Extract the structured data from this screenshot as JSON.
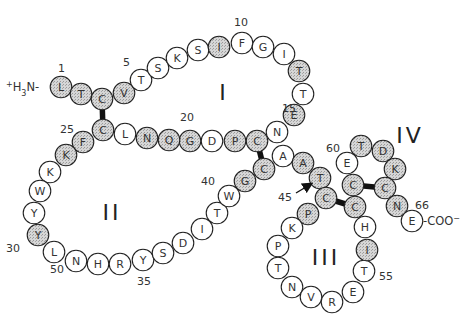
{
  "diagram": {
    "title": "",
    "n_terminus": "+H3N-",
    "c_terminus": "-COO−",
    "loops": [
      {
        "label": "I",
        "x": 224,
        "y": 100
      },
      {
        "label": "II",
        "x": 112,
        "y": 220
      },
      {
        "label": "III",
        "x": 326,
        "y": 265
      },
      {
        "label": "IV",
        "x": 410,
        "y": 143
      }
    ],
    "position_labels": [
      {
        "text": "1",
        "x": 58,
        "y": 72
      },
      {
        "text": "5",
        "x": 123,
        "y": 66
      },
      {
        "text": "10",
        "x": 234,
        "y": 26
      },
      {
        "text": "15",
        "x": 282,
        "y": 112
      },
      {
        "text": "20",
        "x": 180,
        "y": 121
      },
      {
        "text": "25",
        "x": 60,
        "y": 133
      },
      {
        "text": "30",
        "x": 6,
        "y": 252
      },
      {
        "text": "35",
        "x": 137,
        "y": 285
      },
      {
        "text": "40",
        "x": 201,
        "y": 185
      },
      {
        "text": "45",
        "x": 278,
        "y": 201
      },
      {
        "text": "50",
        "x": 50,
        "y": 273
      },
      {
        "text": "55",
        "x": 379,
        "y": 280
      },
      {
        "text": "60",
        "x": 326,
        "y": 152
      },
      {
        "text": "66",
        "x": 415,
        "y": 209
      }
    ],
    "colors": {
      "shaded": "#c8c8c8",
      "unshaded": "#ffffff",
      "stroke": "#222222",
      "bond": "#111111"
    },
    "residues": [
      {
        "n": 1,
        "aa": "L",
        "x": 61,
        "y": 87,
        "shaded": true
      },
      {
        "n": 2,
        "aa": "T",
        "x": 81,
        "y": 94,
        "shaded": true
      },
      {
        "n": 3,
        "aa": "C",
        "x": 102,
        "y": 99,
        "shaded": true
      },
      {
        "n": 4,
        "aa": "V",
        "x": 124,
        "y": 93,
        "shaded": true
      },
      {
        "n": 5,
        "aa": "T",
        "x": 141,
        "y": 80,
        "shaded": false
      },
      {
        "n": 6,
        "aa": "S",
        "x": 158,
        "y": 68,
        "shaded": false
      },
      {
        "n": 7,
        "aa": "K",
        "x": 177,
        "y": 58,
        "shaded": false
      },
      {
        "n": 8,
        "aa": "S",
        "x": 198,
        "y": 50,
        "shaded": false
      },
      {
        "n": 9,
        "aa": "I",
        "x": 219,
        "y": 47,
        "shaded": true
      },
      {
        "n": 10,
        "aa": "F",
        "x": 242,
        "y": 43,
        "shaded": false
      },
      {
        "n": 11,
        "aa": "G",
        "x": 263,
        "y": 47,
        "shaded": false
      },
      {
        "n": 12,
        "aa": "I",
        "x": 284,
        "y": 54,
        "shaded": false
      },
      {
        "n": 13,
        "aa": "T",
        "x": 299,
        "y": 71,
        "shaded": true
      },
      {
        "n": 14,
        "aa": "T",
        "x": 303,
        "y": 94,
        "shaded": false
      },
      {
        "n": 15,
        "aa": "E",
        "x": 294,
        "y": 115,
        "shaded": true
      },
      {
        "n": 16,
        "aa": "N",
        "x": 277,
        "y": 132,
        "shaded": false
      },
      {
        "n": 17,
        "aa": "C",
        "x": 257,
        "y": 141,
        "shaded": true
      },
      {
        "n": 18,
        "aa": "P",
        "x": 235,
        "y": 141,
        "shaded": true
      },
      {
        "n": 19,
        "aa": "D",
        "x": 212,
        "y": 141,
        "shaded": false
      },
      {
        "n": 20,
        "aa": "G",
        "x": 190,
        "y": 141,
        "shaded": true
      },
      {
        "n": 21,
        "aa": "Q",
        "x": 169,
        "y": 140,
        "shaded": true
      },
      {
        "n": 22,
        "aa": "N",
        "x": 147,
        "y": 138,
        "shaded": true
      },
      {
        "n": 23,
        "aa": "L",
        "x": 125,
        "y": 134,
        "shaded": false
      },
      {
        "n": 24,
        "aa": "C",
        "x": 103,
        "y": 130,
        "shaded": true
      },
      {
        "n": 25,
        "aa": "F",
        "x": 83,
        "y": 142,
        "shaded": true
      },
      {
        "n": 26,
        "aa": "K",
        "x": 66,
        "y": 155,
        "shaded": true
      },
      {
        "n": 27,
        "aa": "K",
        "x": 50,
        "y": 172,
        "shaded": false
      },
      {
        "n": 28,
        "aa": "W",
        "x": 40,
        "y": 191,
        "shaded": false
      },
      {
        "n": 29,
        "aa": "Y",
        "x": 34,
        "y": 213,
        "shaded": false
      },
      {
        "n": 30,
        "aa": "Y",
        "x": 38,
        "y": 235,
        "shaded": true
      },
      {
        "n": 31,
        "aa": "L",
        "x": 54,
        "y": 252,
        "shaded": false
      },
      {
        "n": 32,
        "aa": "N",
        "x": 76,
        "y": 261,
        "shaded": false
      },
      {
        "n": 33,
        "aa": "H",
        "x": 98,
        "y": 264,
        "shaded": false
      },
      {
        "n": 34,
        "aa": "R",
        "x": 120,
        "y": 264,
        "shaded": false
      },
      {
        "n": 35,
        "aa": "Y",
        "x": 143,
        "y": 260,
        "shaded": false
      },
      {
        "n": 36,
        "aa": "S",
        "x": 163,
        "y": 253,
        "shaded": false
      },
      {
        "n": 37,
        "aa": "D",
        "x": 183,
        "y": 243,
        "shaded": false
      },
      {
        "n": 38,
        "aa": "I",
        "x": 202,
        "y": 229,
        "shaded": false
      },
      {
        "n": 39,
        "aa": "T",
        "x": 217,
        "y": 213,
        "shaded": false
      },
      {
        "n": 40,
        "aa": "W",
        "x": 229,
        "y": 196,
        "shaded": false
      },
      {
        "n": 41,
        "aa": "G",
        "x": 245,
        "y": 181,
        "shaded": true
      },
      {
        "n": 42,
        "aa": "C",
        "x": 264,
        "y": 169,
        "shaded": true
      },
      {
        "n": 43,
        "aa": "A",
        "x": 283,
        "y": 156,
        "shaded": false
      },
      {
        "n": 44,
        "aa": "A",
        "x": 303,
        "y": 163,
        "shaded": true
      },
      {
        "n": 45,
        "aa": "T",
        "x": 320,
        "y": 178,
        "shaded": true
      },
      {
        "n": 46,
        "aa": "C",
        "x": 326,
        "y": 198,
        "shaded": true
      },
      {
        "n": 47,
        "aa": "P",
        "x": 308,
        "y": 214,
        "shaded": true
      },
      {
        "n": 48,
        "aa": "K",
        "x": 292,
        "y": 228,
        "shaded": false
      },
      {
        "n": 49,
        "aa": "P",
        "x": 278,
        "y": 246,
        "shaded": false
      },
      {
        "n": 50,
        "aa": "T",
        "x": 278,
        "y": 268,
        "shaded": false
      },
      {
        "n": 51,
        "aa": "N",
        "x": 292,
        "y": 287,
        "shaded": false
      },
      {
        "n": 52,
        "aa": "V",
        "x": 311,
        "y": 297,
        "shaded": false
      },
      {
        "n": 53,
        "aa": "R",
        "x": 332,
        "y": 302,
        "shaded": false
      },
      {
        "n": 54,
        "aa": "E",
        "x": 353,
        "y": 292,
        "shaded": false
      },
      {
        "n": 55,
        "aa": "T",
        "x": 364,
        "y": 271,
        "shaded": false
      },
      {
        "n": 56,
        "aa": "I",
        "x": 367,
        "y": 250,
        "shaded": true
      },
      {
        "n": 57,
        "aa": "H",
        "x": 365,
        "y": 227,
        "shaded": false
      },
      {
        "n": 58,
        "aa": "C",
        "x": 355,
        "y": 207,
        "shaded": true
      },
      {
        "n": 59,
        "aa": "C",
        "x": 353,
        "y": 185,
        "shaded": true
      },
      {
        "n": 60,
        "aa": "E",
        "x": 347,
        "y": 163,
        "shaded": false
      },
      {
        "n": 61,
        "aa": "T",
        "x": 361,
        "y": 146,
        "shaded": true
      },
      {
        "n": 62,
        "aa": "D",
        "x": 383,
        "y": 151,
        "shaded": true
      },
      {
        "n": 63,
        "aa": "K",
        "x": 395,
        "y": 169,
        "shaded": true
      },
      {
        "n": 64,
        "aa": "C",
        "x": 385,
        "y": 188,
        "shaded": true
      },
      {
        "n": 65,
        "aa": "N",
        "x": 397,
        "y": 206,
        "shaded": true
      },
      {
        "n": 66,
        "aa": "E",
        "x": 412,
        "y": 221,
        "shaded": false
      }
    ],
    "disulfide_bonds": [
      {
        "from": 3,
        "to": 24
      },
      {
        "from": 17,
        "to": 42
      },
      {
        "from": 46,
        "to": 58
      },
      {
        "from": 59,
        "to": 64
      }
    ],
    "arrow": {
      "label_ref": "45",
      "from": {
        "x": 296,
        "y": 193
      },
      "to": {
        "x": 311,
        "y": 184
      }
    }
  }
}
